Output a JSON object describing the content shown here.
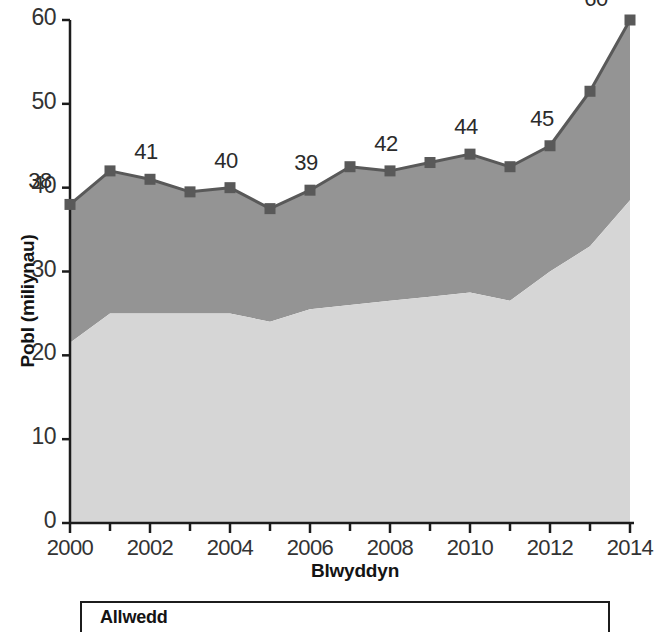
{
  "chart_data": {
    "type": "area",
    "title": "",
    "subtitle": "",
    "xlabel": "Blwyddyn",
    "ylabel": "Pobl (miliynau)",
    "xlim": [
      2000,
      2014
    ],
    "ylim": [
      0,
      60
    ],
    "grid": false,
    "stacked": true,
    "legend_position": "below-plot",
    "categories": [
      2000,
      2001,
      2002,
      2003,
      2004,
      2005,
      2006,
      2007,
      2008,
      2009,
      2010,
      2011,
      2012,
      2013,
      2014
    ],
    "x": [
      "2000",
      "2001",
      "2002",
      "2003",
      "2004",
      "2005",
      "2006",
      "2007",
      "2008",
      "2009",
      "2010",
      "2011",
      "2012",
      "2013",
      "2014"
    ],
    "series": [
      {
        "name": "light-band",
        "color": "#d6d6d6",
        "description": "lower light grey band (cumulative lower boundary)",
        "values": [
          21.5,
          25.0,
          25.0,
          25.0,
          25.0,
          24.0,
          25.5,
          26.0,
          26.5,
          27.0,
          27.5,
          26.5,
          30.0,
          33.0,
          38.5
        ]
      },
      {
        "name": "dark-band",
        "color": "#949494",
        "description": "upper dark grey band (cumulative total, marked line)",
        "values": [
          38.0,
          42.0,
          41.0,
          39.5,
          40.0,
          37.5,
          39.7,
          42.5,
          42.0,
          43.0,
          44.0,
          42.5,
          45.0,
          51.5,
          60.0
        ]
      }
    ],
    "total_line": {
      "name": "total",
      "marker": "square",
      "marker_color": "#595959",
      "line_color": "#595959",
      "values": [
        38.0,
        42.0,
        41.0,
        39.5,
        40.0,
        37.5,
        39.7,
        42.5,
        42.0,
        43.0,
        44.0,
        42.5,
        45.0,
        51.5,
        60.0
      ]
    },
    "data_labels": [
      {
        "x": 2000,
        "y": 38.0,
        "text": "38"
      },
      {
        "x": 2002,
        "y": 41.0,
        "text": "41"
      },
      {
        "x": 2004,
        "y": 40.0,
        "text": "40"
      },
      {
        "x": 2006,
        "y": 39.7,
        "text": "39"
      },
      {
        "x": 2008,
        "y": 42.0,
        "text": "42"
      },
      {
        "x": 2010,
        "y": 44.0,
        "text": "44"
      },
      {
        "x": 2012,
        "y": 45.0,
        "text": "45"
      },
      {
        "x": 2014,
        "y": 60.0,
        "text": "60"
      }
    ],
    "yticks": [
      "0",
      "10",
      "20",
      "30",
      "40",
      "50",
      "60"
    ],
    "ytick_values": [
      0,
      10,
      20,
      30,
      40,
      50,
      60
    ],
    "xticks": [
      "2000",
      "2002",
      "2004",
      "2006",
      "2008",
      "2010",
      "2012",
      "2014"
    ],
    "xtick_values": [
      2000,
      2002,
      2004,
      2006,
      2008,
      2010,
      2012,
      2014
    ],
    "xtick_minor_values": [
      2001,
      2003,
      2005,
      2007,
      2009,
      2011,
      2013
    ]
  },
  "legend": {
    "title": "Allwedd",
    "entries": []
  },
  "colors": {
    "light_band": "#d6d6d6",
    "dark_band": "#949494",
    "line": "#595959",
    "axis": "#1c1c1c",
    "text": "#1a1a1a"
  }
}
